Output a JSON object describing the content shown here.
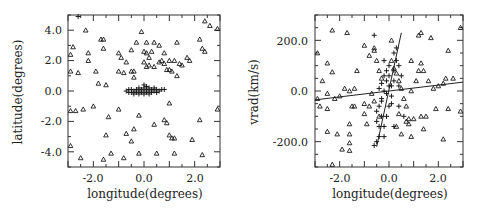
{
  "chart_data": [
    {
      "type": "scatter",
      "title": "",
      "xlabel": "longitude(degrees)",
      "ylabel": "latitude(degrees)",
      "xlim": [
        -3.0,
        3.0
      ],
      "ylim": [
        -5.0,
        5.0
      ],
      "xticks": [
        -2.0,
        0.0,
        2.0
      ],
      "xtick_labels": [
        "-2.0",
        "0.0",
        "2.0"
      ],
      "yticks": [
        -4.0,
        -2.0,
        0.0,
        2.0,
        4.0
      ],
      "ytick_labels": [
        "-4.0",
        "-2.0",
        "0.0",
        "2.0",
        "4.0"
      ],
      "grid": false,
      "legend": null,
      "series": [
        {
          "name": "triangles (field stars)",
          "marker": "triangle-open",
          "points": [
            [
              -2.3,
              4.0
            ],
            [
              -1.7,
              3.4
            ],
            [
              -1.6,
              3.4
            ],
            [
              -2.8,
              2.9
            ],
            [
              -2.9,
              2.4
            ],
            [
              -2.2,
              2.5
            ],
            [
              -2.2,
              2.0
            ],
            [
              -1.6,
              2.8
            ],
            [
              -1.0,
              2.5
            ],
            [
              -0.9,
              2.2
            ],
            [
              -2.9,
              1.3
            ],
            [
              -2.6,
              1.2
            ],
            [
              -1.9,
              1.3
            ],
            [
              -1.0,
              1.3
            ],
            [
              -0.8,
              1.2
            ],
            [
              -1.8,
              0.5
            ],
            [
              -1.5,
              0.4
            ],
            [
              -0.5,
              1.3
            ],
            [
              -0.4,
              1.3
            ],
            [
              -0.4,
              0.9
            ],
            [
              -0.7,
              1.9
            ],
            [
              -0.5,
              2.7
            ],
            [
              -0.3,
              3.2
            ],
            [
              -0.1,
              3.9
            ],
            [
              0.0,
              2.6
            ],
            [
              0.1,
              2.5
            ],
            [
              0.1,
              3.2
            ],
            [
              0.4,
              3.2
            ],
            [
              0.2,
              2.2
            ],
            [
              0.0,
              1.9
            ],
            [
              0.1,
              1.6
            ],
            [
              0.2,
              1.7
            ],
            [
              0.4,
              1.6
            ],
            [
              0.3,
              2.6
            ],
            [
              0.6,
              1.9
            ],
            [
              0.7,
              2.0
            ],
            [
              0.8,
              1.8
            ],
            [
              0.6,
              3.0
            ],
            [
              0.8,
              2.5
            ],
            [
              0.9,
              1.4
            ],
            [
              1.0,
              1.4
            ],
            [
              1.0,
              2.0
            ],
            [
              1.1,
              1.3
            ],
            [
              1.2,
              2.0
            ],
            [
              1.3,
              1.0
            ],
            [
              1.3,
              3.2
            ],
            [
              1.4,
              1.8
            ],
            [
              1.5,
              1.7
            ],
            [
              1.7,
              2.2
            ],
            [
              1.8,
              2.0
            ],
            [
              2.2,
              3.4
            ],
            [
              2.3,
              2.8
            ],
            [
              2.4,
              2.6
            ],
            [
              2.4,
              4.6
            ],
            [
              2.6,
              4.3
            ],
            [
              2.9,
              4.1
            ],
            [
              -2.9,
              -1.3
            ],
            [
              -2.7,
              -1.3
            ],
            [
              -2.4,
              -1.2
            ],
            [
              -2.0,
              -1.0
            ],
            [
              -1.4,
              -1.7
            ],
            [
              -1.0,
              -1.2
            ],
            [
              -0.2,
              -1.6
            ],
            [
              0.4,
              -2.2
            ],
            [
              0.8,
              -1.9
            ],
            [
              0.9,
              -2.1
            ],
            [
              1.0,
              -0.8
            ],
            [
              -0.4,
              -2.5
            ],
            [
              -0.7,
              -2.8
            ],
            [
              -0.5,
              -3.3
            ],
            [
              -1.5,
              -2.9
            ],
            [
              1.0,
              -2.9
            ],
            [
              1.1,
              -3.1
            ],
            [
              1.2,
              -3.1
            ],
            [
              1.9,
              -3.2
            ],
            [
              2.2,
              -1.9
            ],
            [
              2.3,
              -4.2
            ],
            [
              1.2,
              -4.1
            ],
            [
              0.5,
              -4.1
            ],
            [
              -0.2,
              -4.1
            ],
            [
              -0.8,
              -4.4
            ],
            [
              -1.3,
              -4.1
            ],
            [
              -1.6,
              -4.5
            ],
            [
              -2.5,
              -4.4
            ],
            [
              -2.9,
              -3.6
            ],
            [
              2.9,
              -1.2
            ]
          ]
        },
        {
          "name": "crosses (bulge clump)",
          "marker": "plus",
          "points": [
            [
              -0.7,
              0.0
            ],
            [
              -0.6,
              0.1
            ],
            [
              -0.5,
              -0.1
            ],
            [
              -0.5,
              0.1
            ],
            [
              -0.4,
              0.0
            ],
            [
              -0.4,
              -0.2
            ],
            [
              -0.3,
              0.1
            ],
            [
              -0.3,
              -0.1
            ],
            [
              -0.2,
              0.2
            ],
            [
              -0.2,
              0.0
            ],
            [
              -0.2,
              -0.2
            ],
            [
              -0.1,
              0.1
            ],
            [
              -0.1,
              -0.1
            ],
            [
              0.0,
              0.2
            ],
            [
              0.0,
              0.0
            ],
            [
              0.0,
              -0.2
            ],
            [
              0.1,
              0.3
            ],
            [
              0.1,
              0.1
            ],
            [
              0.1,
              -0.1
            ],
            [
              0.2,
              0.2
            ],
            [
              0.2,
              0.0
            ],
            [
              0.2,
              -0.2
            ],
            [
              0.3,
              0.1
            ],
            [
              0.3,
              -0.1
            ],
            [
              0.4,
              0.2
            ],
            [
              0.4,
              0.0
            ],
            [
              0.5,
              0.1
            ],
            [
              0.5,
              -0.1
            ],
            [
              0.6,
              0.0
            ],
            [
              0.7,
              0.1
            ],
            [
              0.8,
              0.1
            ],
            [
              -0.6,
              -0.1
            ],
            [
              0.0,
              0.4
            ],
            [
              -2.6,
              4.9
            ]
          ]
        }
      ]
    },
    {
      "type": "scatter",
      "title": "",
      "xlabel": "longitude(degrees)",
      "ylabel": "vrad(km/s)",
      "xlim": [
        -3.0,
        3.0
      ],
      "ylim": [
        -300.0,
        300.0
      ],
      "xticks": [
        -2.0,
        0.0,
        2.0
      ],
      "xtick_labels": [
        "-2.0",
        "0.0",
        "2.0"
      ],
      "yticks": [
        -200.0,
        0.0,
        200.0
      ],
      "ytick_labels": [
        "-200.0",
        "0.0",
        "200.0"
      ],
      "grid": false,
      "legend": null,
      "lines": [
        {
          "name": "shallow fit (field)",
          "from": [
            -3.0,
            -35.0
          ],
          "to": [
            3.0,
            35.0
          ]
        },
        {
          "name": "steep fit (bulge)",
          "from": [
            -0.5,
            -220.0
          ],
          "to": [
            0.5,
            230.0
          ]
        }
      ],
      "series": [
        {
          "name": "triangles (field stars)",
          "marker": "triangle-open",
          "points": [
            [
              -2.9,
              150
            ],
            [
              -2.5,
              110
            ],
            [
              -2.3,
              240
            ],
            [
              -2.3,
              75
            ],
            [
              -2.7,
              40
            ],
            [
              -2.9,
              -30
            ],
            [
              -2.8,
              -60
            ],
            [
              -2.5,
              -10
            ],
            [
              -2.2,
              -30
            ],
            [
              -2.0,
              -20
            ],
            [
              -1.7,
              230
            ],
            [
              -1.8,
              10
            ],
            [
              -1.6,
              0
            ],
            [
              -1.4,
              10
            ],
            [
              -1.3,
              80
            ],
            [
              -1.5,
              -60
            ],
            [
              -1.6,
              -130
            ],
            [
              -1.4,
              -60
            ],
            [
              -1.0,
              -50
            ],
            [
              -1.0,
              -90
            ],
            [
              -2.5,
              -70
            ],
            [
              -2.5,
              -160
            ],
            [
              -2.1,
              -170
            ],
            [
              -1.9,
              -230
            ],
            [
              -1.6,
              -205
            ],
            [
              -1.6,
              -235
            ],
            [
              -1.6,
              -170
            ],
            [
              -2.3,
              -290
            ],
            [
              -0.9,
              -130
            ],
            [
              -0.8,
              -60
            ],
            [
              -1.0,
              180
            ],
            [
              -0.8,
              140
            ],
            [
              -0.6,
              170
            ],
            [
              -0.6,
              160
            ],
            [
              -0.5,
              120
            ],
            [
              -0.4,
              80
            ],
            [
              -0.3,
              50
            ],
            [
              -0.7,
              -10
            ],
            [
              -0.6,
              -40
            ],
            [
              -0.4,
              -100
            ],
            [
              0.1,
              200
            ],
            [
              0.1,
              120
            ],
            [
              0.2,
              90
            ],
            [
              0.3,
              70
            ],
            [
              0.4,
              40
            ],
            [
              0.5,
              10
            ],
            [
              0.6,
              -30
            ],
            [
              0.7,
              -60
            ],
            [
              0.8,
              -110
            ],
            [
              0.8,
              -130
            ],
            [
              0.9,
              -180
            ],
            [
              1.0,
              -110
            ],
            [
              1.1,
              40
            ],
            [
              1.2,
              80
            ],
            [
              1.3,
              110
            ],
            [
              1.4,
              80
            ],
            [
              1.3,
              -100
            ],
            [
              1.4,
              -150
            ],
            [
              1.5,
              -100
            ],
            [
              1.2,
              220
            ],
            [
              1.3,
              230
            ],
            [
              1.7,
              210
            ],
            [
              1.8,
              10
            ],
            [
              1.9,
              -70
            ],
            [
              2.0,
              20
            ],
            [
              2.2,
              -190
            ],
            [
              2.3,
              50
            ],
            [
              2.2,
              30
            ],
            [
              2.4,
              160
            ],
            [
              2.4,
              -70
            ],
            [
              2.6,
              50
            ],
            [
              2.9,
              250
            ],
            [
              2.9,
              -80
            ],
            [
              1.6,
              40
            ],
            [
              0.9,
              120
            ],
            [
              0.7,
              -120
            ],
            [
              0.5,
              -170
            ],
            [
              0.3,
              -140
            ],
            [
              0.4,
              -90
            ],
            [
              0.9,
              0
            ]
          ]
        },
        {
          "name": "crosses (bulge stars)",
          "marker": "plus",
          "points": [
            [
              -0.6,
              -215
            ],
            [
              -0.5,
              -200
            ],
            [
              -0.4,
              -180
            ],
            [
              -0.4,
              -140
            ],
            [
              -0.5,
              -120
            ],
            [
              -0.3,
              -100
            ],
            [
              -0.4,
              -60
            ],
            [
              -0.3,
              -30
            ],
            [
              -0.2,
              0
            ],
            [
              -0.3,
              30
            ],
            [
              -0.2,
              60
            ],
            [
              -0.1,
              80
            ],
            [
              -0.1,
              40
            ],
            [
              0.0,
              100
            ],
            [
              0.0,
              60
            ],
            [
              0.1,
              20
            ],
            [
              0.1,
              -20
            ],
            [
              0.0,
              -60
            ],
            [
              -0.1,
              -100
            ],
            [
              -0.2,
              -140
            ],
            [
              0.2,
              150
            ],
            [
              0.3,
              170
            ],
            [
              0.3,
              120
            ],
            [
              0.2,
              80
            ],
            [
              -0.2,
              120
            ],
            [
              0.4,
              100
            ],
            [
              0.1,
              -50
            ],
            [
              -0.1,
              -10
            ],
            [
              0.0,
              20
            ],
            [
              -0.3,
              -40
            ],
            [
              -0.5,
              -80
            ],
            [
              0.2,
              40
            ],
            [
              -0.6,
              220
            ],
            [
              -0.2,
              -180
            ],
            [
              0.4,
              -60
            ],
            [
              0.5,
              60
            ],
            [
              0.6,
              -100
            ],
            [
              0.2,
              -140
            ],
            [
              0.4,
              20
            ],
            [
              -0.4,
              10
            ]
          ]
        }
      ]
    }
  ],
  "panels": {
    "left": {
      "xlabel": "longitude(degrees)",
      "ylabel": "latitude(degrees)",
      "xtick_labels": [
        "-2.0",
        "0.0",
        "2.0"
      ],
      "ytick_labels": [
        "4.0",
        "2.0",
        "0.0",
        "-2.0",
        "-4.0"
      ]
    },
    "right": {
      "xlabel": "longitude(degrees)",
      "ylabel": "vrad(km/s)",
      "xtick_labels": [
        "-2.0",
        "0.0",
        "2.0"
      ],
      "ytick_labels": [
        "200.0",
        "0.0",
        "-200.0"
      ]
    }
  },
  "colors": {
    "frame": "#333333",
    "marker": "#1a1a1a",
    "line": "#222222",
    "background": "#ffffff"
  }
}
